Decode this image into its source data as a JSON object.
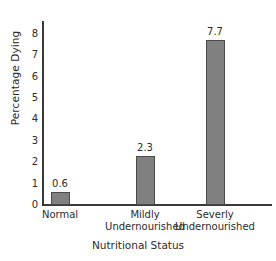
{
  "chart_data": {
    "type": "bar",
    "title": "",
    "xlabel": "Nutritional Status",
    "ylabel": "Percentage Dying",
    "categories": [
      "Normal",
      "Mildly Undernourished",
      "Severly Undernourished"
    ],
    "category_lines": [
      [
        "Normal"
      ],
      [
        "Mildly",
        "Undernourished"
      ],
      [
        "Severly",
        "Undernourished"
      ]
    ],
    "values": [
      0.6,
      2.3,
      7.7
    ],
    "value_labels": [
      "0.6",
      "2.3",
      "7.7"
    ],
    "ylim": [
      0,
      8.6
    ],
    "yticks": [
      0,
      1,
      2,
      3,
      4,
      5,
      6,
      7,
      8
    ],
    "ytick_labels": [
      "0",
      "1",
      "2",
      "3",
      "4",
      "5",
      "6",
      "7",
      "8"
    ],
    "grid": false,
    "legend": false,
    "bar_color": "#808080",
    "bar_edge_color": "#4a4a4a",
    "axis_color": "#3a3a3a",
    "text_color": "#2b2b2b",
    "background": "#ffffff"
  }
}
